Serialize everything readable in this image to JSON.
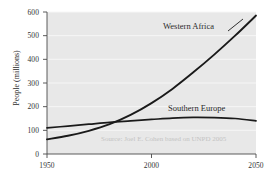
{
  "chart_data": {
    "type": "line",
    "title": "",
    "xlabel": "",
    "ylabel": "People (millions)",
    "xlim": [
      1950,
      2050
    ],
    "ylim": [
      0,
      600
    ],
    "grid": true,
    "legend_position": "inline-annotations",
    "xticks": [
      "1950",
      "2000",
      "2050"
    ],
    "xtick_values": [
      1950,
      2000,
      2050
    ],
    "yticks": [
      "0",
      "100",
      "200",
      "300",
      "400",
      "500",
      "600"
    ],
    "ytick_values": [
      0,
      100,
      200,
      300,
      400,
      500,
      600
    ],
    "x": [
      1950,
      1960,
      1970,
      1980,
      1990,
      2000,
      2010,
      2020,
      2030,
      2040,
      2050
    ],
    "series": [
      {
        "name": "Western Africa",
        "color": "#1a1a1a",
        "values": [
          62,
          77,
          98,
          126,
          165,
          215,
          275,
          345,
          420,
          500,
          585
        ]
      },
      {
        "name": "Southern Europe",
        "color": "#1a1a1a",
        "values": [
          110,
          118,
          126,
          134,
          140,
          146,
          152,
          155,
          154,
          150,
          140
        ]
      }
    ],
    "annotations": [
      {
        "text": "Western Africa",
        "series": "Western Africa"
      },
      {
        "text": "Southern Europe",
        "series": "Southern Europe"
      }
    ],
    "source_note": "Source: Joel E. Cohen based on UNPD 2005",
    "colors": {
      "plot_background": "#e8e8e8",
      "figure_background": "#ffffff",
      "gridline": "#f4f4f4",
      "axis": "#555555",
      "line": "#1a1a1a",
      "source_text": "#c3c3c3",
      "tick_text": "#333333"
    }
  }
}
